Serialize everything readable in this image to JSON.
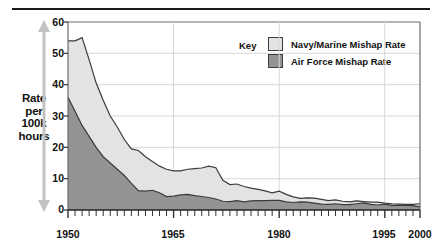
{
  "chart_data": {
    "type": "area",
    "stacked": true,
    "title": "",
    "xlabel": "",
    "ylabel": "Rate per 100k hours",
    "xlim": [
      1950,
      2000
    ],
    "ylim": [
      0,
      60
    ],
    "grid": true,
    "legend_position": "top-right",
    "y_ticks": [
      "0",
      "10",
      "20",
      "30",
      "40",
      "50",
      "60"
    ],
    "x_ticks": [
      "1950",
      "1965",
      "1980",
      "1995",
      "2000"
    ],
    "x_tick_interval_years": 1,
    "x": [
      1950,
      1951,
      1952,
      1953,
      1954,
      1955,
      1956,
      1957,
      1958,
      1959,
      1960,
      1961,
      1962,
      1963,
      1964,
      1965,
      1966,
      1967,
      1968,
      1969,
      1970,
      1971,
      1972,
      1973,
      1974,
      1975,
      1976,
      1977,
      1978,
      1979,
      1980,
      1981,
      1982,
      1983,
      1984,
      1985,
      1986,
      1987,
      1988,
      1989,
      1990,
      1991,
      1992,
      1993,
      1994,
      1995,
      1996,
      1997,
      1998,
      1999,
      2000
    ],
    "series": [
      {
        "name": "Air Force Mishap Rate",
        "color": "#939393",
        "values": [
          36.0,
          31.5,
          27.0,
          23.5,
          20.0,
          17.0,
          15.0,
          13.0,
          11.0,
          8.5,
          6.2,
          6.0,
          6.3,
          5.5,
          4.3,
          4.4,
          4.8,
          5.0,
          4.6,
          4.3,
          4.0,
          3.5,
          2.8,
          2.7,
          3.0,
          2.6,
          2.9,
          3.0,
          3.0,
          3.1,
          3.1,
          2.6,
          2.4,
          2.6,
          2.5,
          2.2,
          1.9,
          1.8,
          2.0,
          1.7,
          1.7,
          2.0,
          2.3,
          1.8,
          1.6,
          1.9,
          1.5,
          1.5,
          1.5,
          1.4,
          1.0
        ]
      },
      {
        "name": "Navy/Marine Mishap Rate",
        "color": "#e3e3e3",
        "values": [
          18.0,
          22.5,
          28.0,
          24.5,
          20.5,
          18.0,
          15.0,
          13.5,
          11.5,
          11.0,
          12.8,
          11.0,
          9.2,
          8.5,
          8.7,
          8.1,
          7.7,
          8.0,
          8.6,
          9.1,
          10.0,
          10.0,
          6.7,
          5.4,
          5.3,
          4.9,
          4.1,
          3.6,
          3.1,
          2.4,
          2.9,
          2.4,
          1.8,
          1.1,
          1.4,
          1.6,
          1.5,
          1.2,
          1.2,
          1.1,
          0.9,
          0.9,
          0.4,
          0.7,
          0.9,
          0.3,
          0.5,
          0.4,
          0.3,
          0.4,
          1.0
        ]
      }
    ],
    "cumulative_top_navy": [
      54.0,
      54.0,
      55.0,
      48.0,
      40.5,
      35.0,
      30.0,
      26.5,
      22.5,
      19.5,
      19.0,
      17.0,
      15.5,
      14.0,
      13.0,
      12.5,
      12.5,
      13.0,
      13.2,
      13.4,
      14.0,
      13.5,
      9.5,
      8.1,
      8.3,
      7.5,
      7.0,
      6.6,
      6.1,
      5.5,
      6.0,
      5.0,
      4.2,
      3.7,
      3.9,
      3.8,
      3.4,
      3.0,
      3.2,
      2.8,
      2.6,
      2.9,
      2.7,
      2.5,
      2.5,
      2.2,
      2.0,
      1.9,
      1.8,
      1.8,
      2.0
    ]
  },
  "header": {
    "rule": ""
  },
  "axis": {
    "y_title_line1": "Rate",
    "y_title_line2": "per",
    "y_title_line3": "100k",
    "y_title_line4": "hours",
    "y_ticks": [
      "60",
      "50",
      "40",
      "30",
      "20",
      "10",
      "0"
    ],
    "x_ticks": [
      "1950",
      "1965",
      "1980",
      "1995",
      "2000"
    ]
  },
  "legend": {
    "key_label": "Key",
    "items": [
      {
        "label": "Navy/Marine Mishap Rate",
        "color": "#e3e3e3"
      },
      {
        "label": "Air Force Mishap Rate",
        "color": "#939393"
      }
    ]
  },
  "colors": {
    "navy_fill": "#e3e3e3",
    "airforce_fill": "#939393",
    "line": "#3b3b3b",
    "grid": "#d8d8d8",
    "axis": "#6b6b6b",
    "text": "#121212",
    "rule": "#1a1a1a",
    "arrow": "#c2c2c2"
  }
}
